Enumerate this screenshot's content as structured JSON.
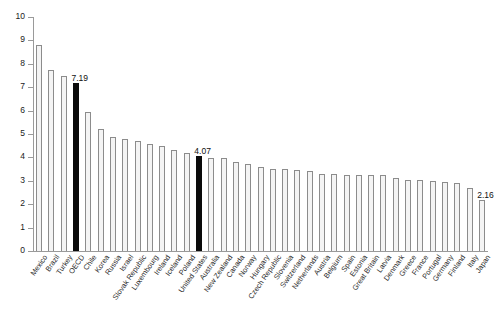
{
  "chart_data": {
    "type": "bar",
    "title": "",
    "xlabel": "",
    "ylabel": "",
    "ylim": [
      0,
      10
    ],
    "ytick_labels": [
      "0",
      "1",
      "2",
      "3",
      "4",
      "5",
      "6",
      "7",
      "8",
      "9",
      "10"
    ],
    "yticks": [
      0,
      1,
      2,
      3,
      4,
      5,
      6,
      7,
      8,
      9,
      10
    ],
    "grid": false,
    "legend": "none",
    "categories": [
      "Mexico",
      "Brazil",
      "Turkey",
      "OECD",
      "Chile",
      "Korea",
      "Russia",
      "Israel",
      "Slovak Republic",
      "Luxembourg",
      "Ireland",
      "Iceland",
      "Poland",
      "United States",
      "Australia",
      "New Zealand",
      "Canada",
      "Norway",
      "Hungary",
      "Czech Republic",
      "Slovenia",
      "Switzerland",
      "Netherlands",
      "Austria",
      "Belgium",
      "Spain",
      "Estonia",
      "Great Britain",
      "Latvia",
      "Denmark",
      "Greece",
      "France",
      "Portugal",
      "Germany",
      "Finland",
      "Italy",
      "Japan"
    ],
    "values": [
      8.82,
      7.73,
      7.5,
      7.19,
      5.92,
      5.22,
      4.86,
      4.77,
      4.69,
      4.58,
      4.5,
      4.33,
      4.18,
      4.07,
      3.98,
      3.97,
      3.82,
      3.72,
      3.61,
      3.52,
      3.5,
      3.46,
      3.42,
      3.3,
      3.29,
      3.26,
      3.26,
      3.24,
      3.25,
      3.14,
      3.05,
      3.02,
      3.0,
      2.93,
      2.9,
      2.7,
      2.16
    ],
    "highlighted": [
      "OECD",
      "United States"
    ],
    "value_labels": [
      {
        "category": "OECD",
        "value": "7.19"
      },
      {
        "category": "United States",
        "value": "4.07"
      },
      {
        "category": "Japan",
        "value": "2.16"
      }
    ],
    "colors": {
      "bar_fill": "#f4f4f4",
      "bar_stroke": "#8c8c8c",
      "highlight_fill": "#0b0b0b",
      "axis": "#9a9a9a",
      "text": "#1a1a1a",
      "background": "#ffffff"
    }
  }
}
